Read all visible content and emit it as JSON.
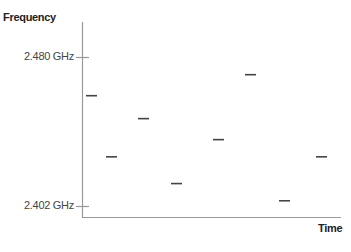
{
  "chart_data": {
    "type": "scatter",
    "title": "",
    "xlabel": "Time",
    "ylabel": "Frequency",
    "y_ticks": [
      {
        "label": "2.480 GHz",
        "value": 2.48
      },
      {
        "label": "2.402 GHz",
        "value": 2.402
      }
    ],
    "ylim": [
      2.402,
      2.48
    ],
    "y_unit": "GHz",
    "marker": "horizontal-dash",
    "grid": false,
    "legend": null,
    "x": [
      1,
      2,
      3,
      4,
      5,
      6,
      7,
      8
    ],
    "values": [
      2.46,
      2.428,
      2.448,
      2.414,
      2.437,
      2.471,
      2.405,
      2.428
    ],
    "series": [
      {
        "name": "Frequency hops",
        "points": [
          {
            "x": 1,
            "y": 2.46
          },
          {
            "x": 2,
            "y": 2.428
          },
          {
            "x": 3,
            "y": 2.448
          },
          {
            "x": 4,
            "y": 2.414
          },
          {
            "x": 5,
            "y": 2.437
          },
          {
            "x": 6,
            "y": 2.471
          },
          {
            "x": 7,
            "y": 2.405
          },
          {
            "x": 8,
            "y": 2.428
          }
        ]
      }
    ],
    "colors": {
      "axis": "#999999",
      "marker": "#444444",
      "text": "#222222"
    }
  },
  "labels": {
    "ylabel": "Frequency",
    "xlabel": "Time",
    "ytick_top": "2.480 GHz",
    "ytick_bottom": "2.402 GHz"
  }
}
